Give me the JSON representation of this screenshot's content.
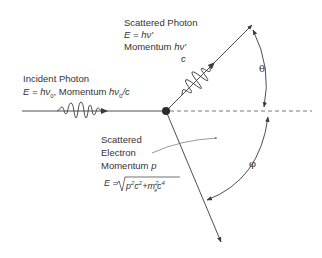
{
  "diagram": {
    "incident_photon": {
      "label": "Incident Photon",
      "energy_prefix": "E",
      "energy_eq": " = hν",
      "energy_sub": "0",
      "momentum_text": ", Momentum ",
      "momentum_eq": "hν",
      "momentum_sub": "0",
      "momentum_tail": "/c"
    },
    "scattered_photon": {
      "label": "Scattered Photon",
      "energy": "E = hν'",
      "momentum_label": "Momentum ",
      "momentum_num": "hν'",
      "momentum_den": "c"
    },
    "scattered_electron": {
      "label_line1": "Scattered",
      "label_line2": "Electron",
      "momentum_label": "Momentum ",
      "momentum_symbol": "p",
      "energy_formula": "E = √(p²c² + mₑ²c⁴)"
    },
    "angles": {
      "theta": "θ",
      "phi": "φ"
    },
    "colors": {
      "line": "#3a3a3a",
      "dashed": "#6a6a6a",
      "background": "#ffffff"
    }
  }
}
